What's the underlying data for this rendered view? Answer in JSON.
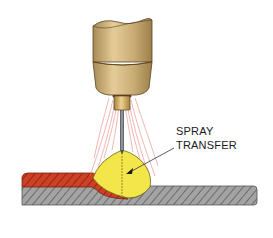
{
  "diagram": {
    "label": {
      "line1": "SPRAY",
      "line2": "TRANSFER"
    },
    "parts": [
      {
        "name": "torch-nozzle",
        "color": "#c9ad7a"
      },
      {
        "name": "contact-tip",
        "color": "#c8a46a"
      },
      {
        "name": "electrode-wire",
        "color": "#6f7378"
      },
      {
        "name": "shielding-gas-lines",
        "color": "#e8736a"
      },
      {
        "name": "arc-cone",
        "color": "#f3e64a"
      },
      {
        "name": "droplet-stream",
        "color": "#b89a2e"
      },
      {
        "name": "weld-bead",
        "color": "#c43b22"
      },
      {
        "name": "base-metal",
        "color": "#9a9a9a"
      }
    ]
  }
}
